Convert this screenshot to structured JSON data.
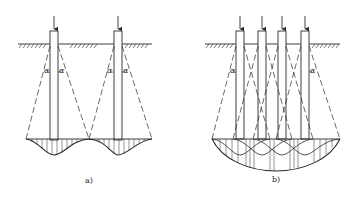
{
  "diagram": {
    "stroke_color": "#2a2a2a",
    "panels": [
      {
        "id": "a",
        "label": "a)",
        "description": "Widely spaced piles – stress zones do not overlap",
        "angle_symbol": "α",
        "piles": 2
      },
      {
        "id": "b",
        "label": "b)",
        "description": "Closely spaced pile group – stress zones overlap",
        "angle_symbol": "α",
        "piles": 4
      }
    ]
  }
}
